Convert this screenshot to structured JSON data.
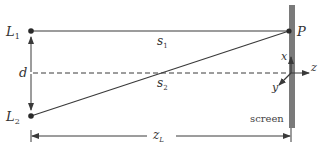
{
  "diagram": {
    "labels": {
      "source1": {
        "main": "L",
        "sub": "1"
      },
      "source2": {
        "main": "L",
        "sub": "2"
      },
      "point": "P",
      "path1": {
        "main": "s",
        "sub": "1"
      },
      "path2": {
        "main": "s",
        "sub": "2"
      },
      "separation": "d",
      "distance": {
        "main": "z",
        "sub": "L"
      },
      "screen": "screen",
      "axis_x": "x",
      "axis_y": "y",
      "axis_z": "z"
    },
    "colors": {
      "line": "#3a3a3a",
      "screen": "#7a7a7a",
      "text": "#333333",
      "background": "#ffffff"
    }
  }
}
